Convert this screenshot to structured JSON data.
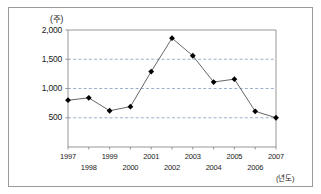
{
  "chart_data": {
    "type": "line",
    "title": "",
    "subtitle": "",
    "xlabel": "(년도)",
    "ylabel": "(주)",
    "x": [
      1997,
      1998,
      1999,
      2000,
      2001,
      2002,
      2003,
      2004,
      2005,
      2006,
      2007
    ],
    "categories": [
      "1997",
      "1998",
      "1999",
      "2000",
      "2001",
      "2002",
      "2003",
      "2004",
      "2005",
      "2006",
      "2007"
    ],
    "values": [
      800,
      840,
      620,
      690,
      1290,
      1860,
      1560,
      1110,
      1160,
      610,
      500
    ],
    "series": [
      {
        "name": "",
        "values": [
          800,
          840,
          620,
          690,
          1290,
          1860,
          1560,
          1110,
          1160,
          610,
          500
        ]
      }
    ],
    "ylim": [
      0,
      2000
    ],
    "xlim": [
      1997,
      2007
    ],
    "yticks": [
      500,
      1000,
      1500,
      2000
    ],
    "ytick_labels": [
      "500",
      "1,000",
      "1,500",
      "2,000"
    ],
    "xtick_labels": [
      "1997",
      "1998",
      "1999",
      "2000",
      "2001",
      "2002",
      "2003",
      "2004",
      "2005",
      "2006",
      "2007"
    ],
    "grid": true,
    "grid_axis": "y",
    "grid_style": "dashed",
    "legend": false,
    "legend_position": "none",
    "marker": "diamond",
    "line_color": "#555555",
    "marker_color": "#000000",
    "grid_color": "#6f8fb5",
    "axis_color": "#8a8a8a",
    "frame_color": "#9a9a9a",
    "background": "#ffffff",
    "annotations": []
  },
  "axis": {
    "y_unit": "(주)",
    "x_unit": "(년도)"
  }
}
